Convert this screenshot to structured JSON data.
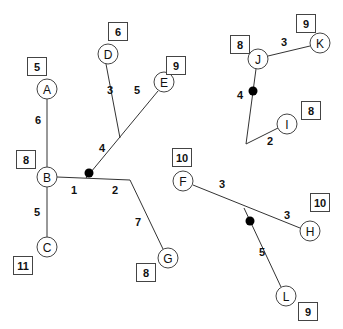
{
  "diagram": {
    "title": "",
    "nodes": [
      {
        "id": "A",
        "label": "A",
        "x": 47,
        "y": 89,
        "value": "5",
        "box": [
          27,
          57
        ]
      },
      {
        "id": "B",
        "label": "B",
        "x": 47,
        "y": 177,
        "value": "8",
        "box": [
          16,
          150
        ]
      },
      {
        "id": "C",
        "label": "C",
        "x": 47,
        "y": 247,
        "value": "11",
        "box": [
          13,
          256
        ]
      },
      {
        "id": "D",
        "label": "D",
        "x": 108,
        "y": 54,
        "value": "6",
        "box": [
          108,
          22
        ]
      },
      {
        "id": "E",
        "label": "E",
        "x": 164,
        "y": 82,
        "value": "9",
        "box": [
          166,
          56
        ]
      },
      {
        "id": "G",
        "label": "G",
        "x": 168,
        "y": 258,
        "value": "8",
        "box": [
          136,
          263
        ]
      },
      {
        "id": "F",
        "label": "F",
        "x": 183,
        "y": 181,
        "value": "10",
        "box": [
          172,
          148
        ]
      },
      {
        "id": "H",
        "label": "H",
        "x": 310,
        "y": 231,
        "value": "10",
        "box": [
          310,
          193
        ]
      },
      {
        "id": "L",
        "label": "L",
        "x": 286,
        "y": 296,
        "value": "9",
        "box": [
          298,
          302
        ]
      },
      {
        "id": "J",
        "label": "J",
        "x": 258,
        "y": 59,
        "value": "8",
        "box": [
          230,
          35
        ]
      },
      {
        "id": "K",
        "label": "K",
        "x": 320,
        "y": 43,
        "value": "9",
        "box": [
          296,
          14
        ]
      },
      {
        "id": "I",
        "label": "I",
        "x": 287,
        "y": 124,
        "value": "8",
        "box": [
          301,
          101
        ]
      }
    ],
    "edges": [
      {
        "points": "47,99 47,167",
        "weight": "6",
        "lx": 38,
        "ly": 122
      },
      {
        "points": "47,187 47,237",
        "weight": "5",
        "lx": 38,
        "ly": 211
      },
      {
        "points": "57,177 130,180",
        "weight": "1",
        "lx": 74,
        "ly": 190
      },
      {
        "points": "130,180 168,248",
        "weight": "2/7",
        "lx": 0,
        "ly": 0
      },
      {
        "points": "106,64 120,138",
        "weight": "3",
        "lx": 111,
        "ly": 90
      },
      {
        "points": "158,91 86,178",
        "weight": "5/4",
        "lx": 0,
        "ly": 0
      },
      {
        "points": "193,185 300,227",
        "weight": "3/3",
        "lx": 0,
        "ly": 0
      },
      {
        "points": "244,208 281,287",
        "weight": "5",
        "lx": 262,
        "ly": 252
      },
      {
        "points": "268,56 310,46",
        "weight": "3",
        "lx": 284,
        "ly": 42
      },
      {
        "points": "256,69 246,144 278,128",
        "weight": "4/2",
        "lx": 0,
        "ly": 0
      }
    ],
    "weight_labels": [
      {
        "text": "6",
        "x": 38,
        "y": 120
      },
      {
        "text": "5",
        "x": 37,
        "y": 212
      },
      {
        "text": "1",
        "x": 74,
        "y": 190
      },
      {
        "text": "2",
        "x": 115,
        "y": 190
      },
      {
        "text": "7",
        "x": 138,
        "y": 222
      },
      {
        "text": "3",
        "x": 110,
        "y": 90
      },
      {
        "text": "5",
        "x": 137,
        "y": 90
      },
      {
        "text": "4",
        "x": 102,
        "y": 148
      },
      {
        "text": "3",
        "x": 222,
        "y": 184
      },
      {
        "text": "3",
        "x": 287,
        "y": 215
      },
      {
        "text": "5",
        "x": 262,
        "y": 252
      },
      {
        "text": "3",
        "x": 284,
        "y": 42
      },
      {
        "text": "4",
        "x": 240,
        "y": 95
      },
      {
        "text": "2",
        "x": 270,
        "y": 141
      }
    ],
    "dots": [
      {
        "x": 89,
        "y": 173
      },
      {
        "x": 250,
        "y": 221
      },
      {
        "x": 253,
        "y": 91
      }
    ],
    "colors": {
      "line": "#333333",
      "dot": "#000000",
      "background": "#ffffff"
    }
  }
}
